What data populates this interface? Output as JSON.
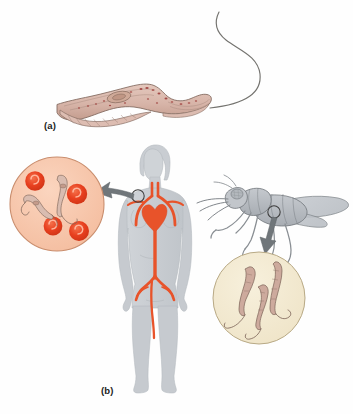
{
  "figure": {
    "background_color": "#fefefe",
    "width": 353,
    "height": 414
  },
  "panels": [
    {
      "id": "a",
      "label": "(a)",
      "caption_text": "(a)",
      "subject": "trypanosome-organism",
      "description": "Single elongated trypanosome with undulating membrane, nucleus and long free flagellum"
    },
    {
      "id": "b",
      "label": "(b)",
      "caption_text": "(b)",
      "subject": "transmission-cycle",
      "description": "Human host with circulatory system, blood smear inset, tsetse fly vector and fly gut inset"
    }
  ],
  "organism": {
    "name": "trypanosome",
    "body_color": "#d8b6ab",
    "body_outline": "#7a6258",
    "nucleus_color": "#c9a294",
    "flagellum_color": "#6f6f72",
    "granule_color": "#a0504f"
  },
  "human": {
    "name": "human-host",
    "silhouette_color": "#c9cdd2",
    "silhouette_outline": "#b0b5ba",
    "circulatory_color": "#e8532a",
    "heart_color": "#e8532a",
    "marker_label": "blood-sample-site"
  },
  "fly": {
    "name": "tsetse-fly-vector",
    "body_color": "#b9bdc2",
    "outline_color": "#6d7276",
    "wing_color": "#c6cacf",
    "marker_label": "gut-sample-site"
  },
  "insets": [
    {
      "id": "blood-smear",
      "name": "human-blood-inset",
      "fill_color": "#f7c6ab",
      "outline_color": "#c98d6d",
      "contents": "red blood cells and trypanosomes",
      "red_blood_cell_count": 5,
      "trypanosome_count": 2,
      "rbc_color": "#e8401f",
      "rbc_highlight": "#f4714b"
    },
    {
      "id": "fly-gut",
      "name": "fly-gut-inset",
      "fill_color": "#f3ead2",
      "outline_color": "#b8a985",
      "contents": "trypanosomes in fly gut",
      "trypanosome_count": 3
    }
  ],
  "arrows": [
    {
      "id": "arrow-human",
      "name": "human-to-blood-inset-arrow",
      "direction": "right-to-left",
      "color": "#6e7478",
      "from": "human neck marker",
      "to": "blood smear inset"
    },
    {
      "id": "arrow-fly",
      "name": "fly-to-gut-inset-arrow",
      "direction": "up-to-down",
      "color": "#6e7478",
      "from": "fly abdomen marker",
      "to": "fly gut inset"
    }
  ],
  "colors": {
    "accent_red": "#e8532a",
    "gray_silhouette": "#c9cdd2",
    "peach_inset": "#f7c6ab",
    "cream_inset": "#f3ead2",
    "parasite_body": "#d8b6ab",
    "outline_dark": "#6d7276"
  }
}
